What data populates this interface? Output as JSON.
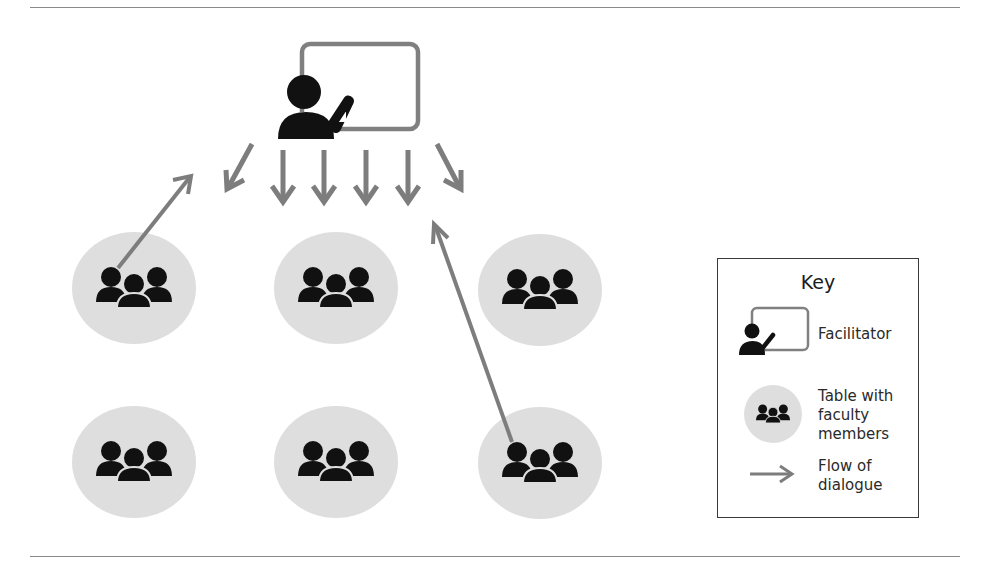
{
  "colors": {
    "arrow": "#7d7d7d",
    "board": "#808080",
    "icon": "#111111",
    "table_circle": "#dedede",
    "rule": "#8a8a8a",
    "legend_border": "#3a3a3a"
  },
  "facilitator": {
    "label": "Facilitator",
    "x": 278,
    "y": 44
  },
  "tables": [
    {
      "id": "table-1",
      "cx": 134,
      "cy": 288
    },
    {
      "id": "table-2",
      "cx": 336,
      "cy": 288
    },
    {
      "id": "table-3",
      "cx": 540,
      "cy": 290
    },
    {
      "id": "table-4",
      "cx": 134,
      "cy": 462
    },
    {
      "id": "table-5",
      "cx": 336,
      "cy": 462
    },
    {
      "id": "table-6",
      "cx": 540,
      "cy": 463
    }
  ],
  "arrows": {
    "facilitator_out": [
      {
        "x1": 252,
        "y1": 144,
        "x2": 227,
        "y2": 189
      },
      {
        "x1": 283,
        "y1": 150,
        "x2": 283,
        "y2": 202
      },
      {
        "x1": 324,
        "y1": 150,
        "x2": 324,
        "y2": 202
      },
      {
        "x1": 366,
        "y1": 150,
        "x2": 366,
        "y2": 202
      },
      {
        "x1": 408,
        "y1": 150,
        "x2": 408,
        "y2": 202
      },
      {
        "x1": 437,
        "y1": 144,
        "x2": 461,
        "y2": 189
      }
    ],
    "table_to_facilitator": [
      {
        "from": "table-1",
        "x1": 118,
        "y1": 268,
        "x2": 191,
        "y2": 176
      },
      {
        "from": "table-6",
        "x1": 512,
        "y1": 442,
        "x2": 434,
        "y2": 224
      }
    ]
  },
  "legend": {
    "title": "Key",
    "items": [
      {
        "icon": "facilitator-icon",
        "lines": [
          "Facilitator"
        ]
      },
      {
        "icon": "table-group-icon",
        "lines": [
          "Table with",
          "faculty",
          "members"
        ]
      },
      {
        "icon": "arrow-right-icon",
        "lines": [
          "Flow of",
          "dialogue"
        ]
      }
    ]
  }
}
